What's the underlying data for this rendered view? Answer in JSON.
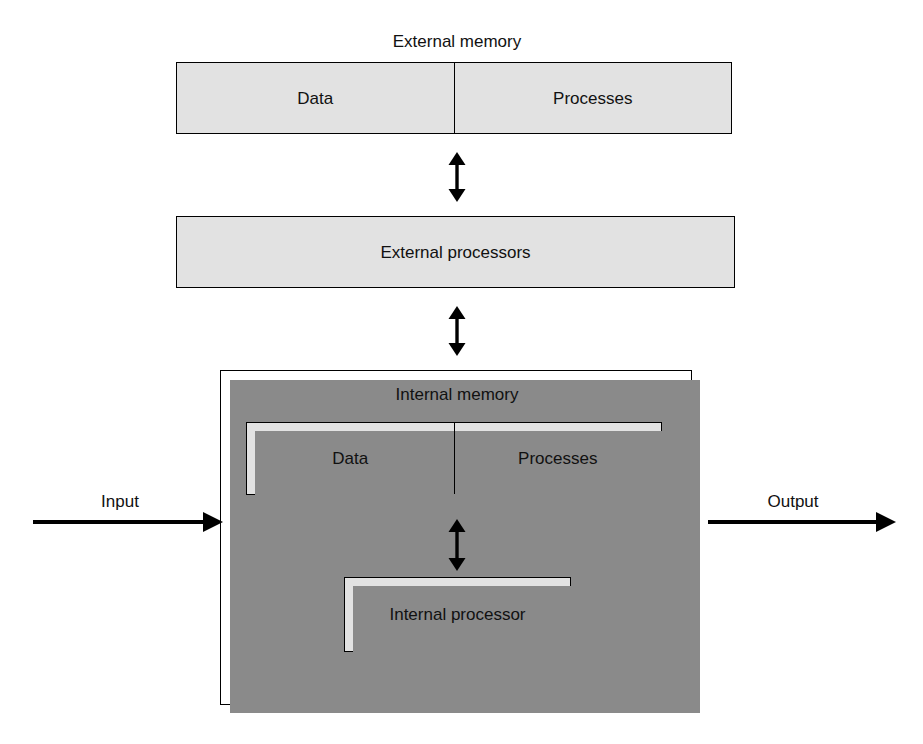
{
  "diagram": {
    "colors": {
      "box_fill": "#e2e2e2",
      "container_fill": "#ffffff",
      "border": "#000000",
      "shadow": "#8a8a8a",
      "text": "#111111",
      "background": "#ffffff"
    }
  },
  "labels": {
    "external_memory": "External memory",
    "internal_memory": "Internal memory",
    "input": "Input",
    "output": "Output"
  },
  "external_memory_box": {
    "caption": "External memory",
    "cells": [
      {
        "label": "Data"
      },
      {
        "label": "Processes"
      }
    ]
  },
  "external_processors_box": {
    "label": "External processors"
  },
  "internal_memory_box": {
    "caption": "Internal memory",
    "cells": [
      {
        "label": "Data"
      },
      {
        "label": "Processes"
      }
    ]
  },
  "internal_processor_box": {
    "label": "Internal processor"
  },
  "connectors": {
    "memory_to_processors": {
      "kind": "double-headed-vertical-arrow"
    },
    "processors_to_system": {
      "kind": "double-headed-vertical-arrow"
    },
    "internal_memory_to_processor": {
      "kind": "double-headed-vertical-arrow"
    },
    "input_arrow": {
      "kind": "right-arrow",
      "label": "Input"
    },
    "output_arrow": {
      "kind": "right-arrow",
      "label": "Output"
    }
  }
}
